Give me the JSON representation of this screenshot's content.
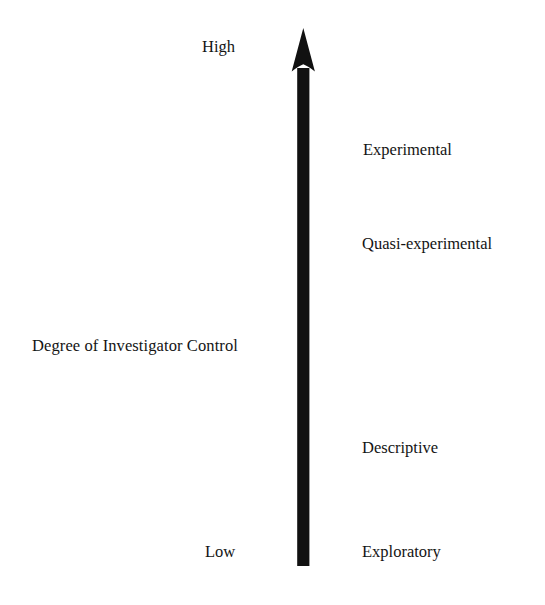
{
  "figure": {
    "type": "axis-diagram",
    "background_color": "#ffffff",
    "ink_color": "#141414",
    "axis": {
      "name": "Degree of Investigator Control",
      "title": "Degree of Investigator Control",
      "orientation": "vertical",
      "direction": "upward",
      "high_label": "High",
      "low_label": "Low",
      "arrow_icon": "up-arrow-icon",
      "arrow_color": "#111111"
    },
    "tiers": [
      {
        "label": "Experimental",
        "rank": 4,
        "control": "highest"
      },
      {
        "label": "Quasi-experimental",
        "rank": 3,
        "control": "high"
      },
      {
        "label": "Descriptive",
        "rank": 2,
        "control": "low"
      },
      {
        "label": "Exploratory",
        "rank": 1,
        "control": "lowest"
      }
    ]
  }
}
